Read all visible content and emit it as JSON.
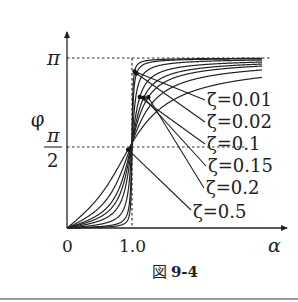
{
  "chart_data": {
    "type": "line",
    "title": "",
    "xlabel": "α",
    "ylabel": "φ",
    "x_ticks": [
      "0",
      "1.0"
    ],
    "y_ticks": [
      "π/2",
      "π"
    ],
    "xlim": [
      0,
      3.4
    ],
    "ylim": [
      0,
      3.5
    ],
    "grid": false,
    "reference_lines": [
      {
        "orientation": "horizontal",
        "value": "π",
        "style": "dotted"
      },
      {
        "orientation": "horizontal",
        "value": "π/2",
        "style": "dotted"
      },
      {
        "orientation": "vertical",
        "value": 1.0,
        "style": "dotted"
      }
    ],
    "legend_position": "annotations-right",
    "series": [
      {
        "name": "ζ=0.01",
        "zeta": 0.01
      },
      {
        "name": "ζ=0.02",
        "zeta": 0.02
      },
      {
        "name": "ζ=0.1",
        "zeta": 0.1
      },
      {
        "name": "ζ=0.15",
        "zeta": 0.15
      },
      {
        "name": "ζ=0.2",
        "zeta": 0.2
      },
      {
        "name": "ζ=0.5",
        "zeta": 0.5
      }
    ],
    "formula": "φ = atan2(2ζα, 1 − α²)",
    "caption": "図 9-4"
  },
  "axes": {
    "x_label": "α",
    "y_label": "φ",
    "x_tick_0": "0",
    "x_tick_1": "1.0",
    "y_tick_pi": "π",
    "y_tick_half_num": "π",
    "y_tick_half_den": "2"
  },
  "annotations": [
    {
      "label": "ζ=0.01"
    },
    {
      "label": "ζ=0.02"
    },
    {
      "label": "ζ=0.1"
    },
    {
      "label": "ζ=0.15"
    },
    {
      "label": "ζ=0.2"
    },
    {
      "label": "ζ=0.5"
    }
  ],
  "caption": {
    "prefix": "図",
    "number": "9-4"
  }
}
